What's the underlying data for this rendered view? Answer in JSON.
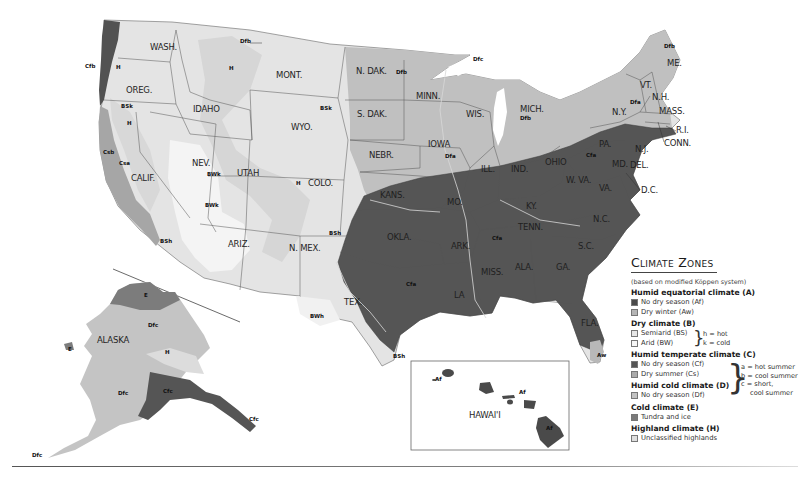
{
  "legend": {
    "title": "Climate Zones",
    "subtitle": "(based on modified Köppen system)",
    "groups": [
      {
        "label": "Humid equatorial climate (A)",
        "items": [
          {
            "label": "No dry season (Af)",
            "color": "#4a4a4a"
          },
          {
            "label": "Dry winter (Aw)",
            "color": "#b5b5b5"
          }
        ]
      },
      {
        "label": "Dry climate (B)",
        "items": [
          {
            "label": "Semiarid (BS)",
            "color": "#e6e6e6"
          },
          {
            "label": "Arid (BW)",
            "color": "#f6f6f6"
          }
        ]
      },
      {
        "label": "Humid temperate climate (C)",
        "items": [
          {
            "label": "No dry season (Cf)",
            "color": "#555555"
          },
          {
            "label": "Dry summer (Cs)",
            "color": "#aaaaaa"
          }
        ]
      },
      {
        "label": "Humid cold climate (D)",
        "items": [
          {
            "label": "No dry season (Df)",
            "color": "#c2c2c2"
          }
        ]
      },
      {
        "label": "Cold climate (E)",
        "items": [
          {
            "label": "Tundra and ice",
            "color": "#7a7a7a"
          }
        ]
      },
      {
        "label": "Highland climate (H)",
        "items": [
          {
            "label": "Unclassified highlands",
            "color": "#dedede"
          }
        ]
      }
    ],
    "b_notes": [
      "h = hot",
      "k = cold"
    ],
    "cd_notes": [
      "a = hot summer",
      "b = cool summer",
      "c = short,",
      "cool summer"
    ]
  },
  "states": [
    {
      "name": "WASH.",
      "x": 150,
      "y": 50
    },
    {
      "name": "OREG.",
      "x": 126,
      "y": 93
    },
    {
      "name": "IDAHO",
      "x": 193,
      "y": 112
    },
    {
      "name": "MONT.",
      "x": 276,
      "y": 78
    },
    {
      "name": "WYO.",
      "x": 291,
      "y": 130
    },
    {
      "name": "CALIF.",
      "x": 131,
      "y": 181
    },
    {
      "name": "NEV.",
      "x": 192,
      "y": 166
    },
    {
      "name": "UTAH",
      "x": 237,
      "y": 176
    },
    {
      "name": "COLO.",
      "x": 308,
      "y": 186
    },
    {
      "name": "ARIZ.",
      "x": 228,
      "y": 247
    },
    {
      "name": "N. MEX.",
      "x": 289,
      "y": 251
    },
    {
      "name": "N. DAK.",
      "x": 356,
      "y": 74
    },
    {
      "name": "S. DAK.",
      "x": 357,
      "y": 117
    },
    {
      "name": "NEBR.",
      "x": 369,
      "y": 158
    },
    {
      "name": "KANS.",
      "x": 380,
      "y": 198
    },
    {
      "name": "OKLA.",
      "x": 387,
      "y": 240
    },
    {
      "name": "TEX.",
      "x": 344,
      "y": 305
    },
    {
      "name": "MINN.",
      "x": 416,
      "y": 99
    },
    {
      "name": "IOWA",
      "x": 428,
      "y": 147
    },
    {
      "name": "MO.",
      "x": 447,
      "y": 205
    },
    {
      "name": "ARK.",
      "x": 451,
      "y": 249
    },
    {
      "name": "LA",
      "x": 454,
      "y": 298
    },
    {
      "name": "WIS.",
      "x": 466,
      "y": 117
    },
    {
      "name": "ILL.",
      "x": 481,
      "y": 172
    },
    {
      "name": "MISS.",
      "x": 481,
      "y": 275
    },
    {
      "name": "MICH.",
      "x": 520,
      "y": 112
    },
    {
      "name": "IND.",
      "x": 511,
      "y": 172
    },
    {
      "name": "KY.",
      "x": 526,
      "y": 209
    },
    {
      "name": "TENN.",
      "x": 518,
      "y": 230
    },
    {
      "name": "ALA.",
      "x": 515,
      "y": 270
    },
    {
      "name": "OHIO",
      "x": 545,
      "y": 165
    },
    {
      "name": "GA.",
      "x": 556,
      "y": 270
    },
    {
      "name": "FLA.",
      "x": 581,
      "y": 326
    },
    {
      "name": "S.C.",
      "x": 578,
      "y": 249
    },
    {
      "name": "N.C.",
      "x": 593,
      "y": 222
    },
    {
      "name": "W. VA.",
      "x": 566,
      "y": 183
    },
    {
      "name": "VA.",
      "x": 599,
      "y": 191
    },
    {
      "name": "PA.",
      "x": 599,
      "y": 147
    },
    {
      "name": "N.Y.",
      "x": 612,
      "y": 115
    },
    {
      "name": "ME.",
      "x": 667,
      "y": 66
    },
    {
      "name": "VT.",
      "x": 640,
      "y": 88
    },
    {
      "name": "N.H.",
      "x": 652,
      "y": 100
    },
    {
      "name": "MASS.",
      "x": 659,
      "y": 114
    },
    {
      "name": "N.J.",
      "x": 635,
      "y": 152
    },
    {
      "name": "MD.",
      "x": 612,
      "y": 167
    },
    {
      "name": "DEL.",
      "x": 630,
      "y": 168
    },
    {
      "name": "D.C.",
      "x": 641,
      "y": 193
    },
    {
      "name": "R.I.",
      "x": 676,
      "y": 133
    },
    {
      "name": "CONN.",
      "x": 664,
      "y": 146
    },
    {
      "name": "ALASKA",
      "x": 97,
      "y": 343
    },
    {
      "name": "HAWAI'I",
      "x": 469,
      "y": 418
    }
  ],
  "zones": [
    {
      "code": "Cfb",
      "x": 85,
      "y": 68
    },
    {
      "code": "H",
      "x": 116,
      "y": 69
    },
    {
      "code": "Dfb",
      "x": 240,
      "y": 43
    },
    {
      "code": "H",
      "x": 229,
      "y": 70
    },
    {
      "code": "BSk",
      "x": 121,
      "y": 108
    },
    {
      "code": "BSk",
      "x": 320,
      "y": 110
    },
    {
      "code": "H",
      "x": 127,
      "y": 125
    },
    {
      "code": "Csb",
      "x": 103,
      "y": 154
    },
    {
      "code": "Csa",
      "x": 119,
      "y": 165
    },
    {
      "code": "BWk",
      "x": 207,
      "y": 176
    },
    {
      "code": "BWk",
      "x": 205,
      "y": 207
    },
    {
      "code": "H",
      "x": 296,
      "y": 185
    },
    {
      "code": "BSh",
      "x": 160,
      "y": 243
    },
    {
      "code": "BSh",
      "x": 329,
      "y": 235
    },
    {
      "code": "BWh",
      "x": 310,
      "y": 318
    },
    {
      "code": "BSh",
      "x": 393,
      "y": 358
    },
    {
      "code": "Dfb",
      "x": 396,
      "y": 74
    },
    {
      "code": "Dfc",
      "x": 473,
      "y": 61
    },
    {
      "code": "Dfb",
      "x": 520,
      "y": 120
    },
    {
      "code": "Dfa",
      "x": 445,
      "y": 158
    },
    {
      "code": "Dfa",
      "x": 630,
      "y": 104
    },
    {
      "code": "Dfb",
      "x": 664,
      "y": 48
    },
    {
      "code": "Cfa",
      "x": 586,
      "y": 157
    },
    {
      "code": "Cfa",
      "x": 492,
      "y": 240
    },
    {
      "code": "Cfa",
      "x": 406,
      "y": 286
    },
    {
      "code": "Aw",
      "x": 597,
      "y": 357
    },
    {
      "code": "Af",
      "x": 435,
      "y": 381
    },
    {
      "code": "Af",
      "x": 519,
      "y": 394
    },
    {
      "code": "Af",
      "x": 546,
      "y": 430
    },
    {
      "code": "E",
      "x": 144,
      "y": 297
    },
    {
      "code": "E",
      "x": 68,
      "y": 351
    },
    {
      "code": "Dfc",
      "x": 148,
      "y": 327
    },
    {
      "code": "H",
      "x": 165,
      "y": 354
    },
    {
      "code": "Dfc",
      "x": 118,
      "y": 395
    },
    {
      "code": "Cfc",
      "x": 163,
      "y": 393
    },
    {
      "code": "Cfc",
      "x": 249,
      "y": 421
    },
    {
      "code": "Dfc",
      "x": 32,
      "y": 457
    }
  ]
}
